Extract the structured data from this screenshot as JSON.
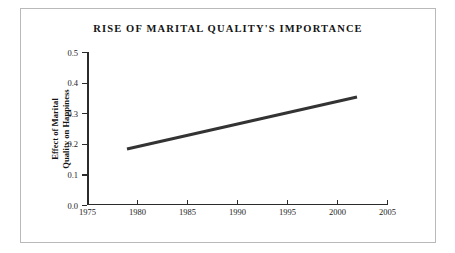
{
  "chart_data": {
    "type": "line",
    "title": "RISE OF MARITAL QUALITY'S IMPORTANCE",
    "xlabel": "",
    "ylabel_lines": [
      "Effect of Marital",
      "Quality on Happiness"
    ],
    "ylabel": "Effect of Marital Quality on Happiness",
    "xlim": [
      1975,
      2005
    ],
    "ylim": [
      0.0,
      0.5
    ],
    "xticks": [
      1975,
      1980,
      1985,
      1990,
      1995,
      2000,
      2005
    ],
    "xtick_labels": [
      "1975",
      "1980",
      "1985",
      "1990",
      "1995",
      "2000",
      "2005"
    ],
    "yticks": [
      0.0,
      0.1,
      0.2,
      0.3,
      0.4,
      0.5
    ],
    "ytick_labels": [
      "0.0",
      "0.1",
      "0.2",
      "0.3",
      "0.4",
      "0.5"
    ],
    "grid": false,
    "legend": false,
    "series": [
      {
        "name": "Effect of marital quality on happiness",
        "color": "#333333",
        "linewidth": 3,
        "x": [
          1979,
          2002
        ],
        "values": [
          0.183,
          0.353
        ]
      }
    ]
  },
  "figure": {
    "border_color": "#b9b9b9",
    "background": "#ffffff",
    "axis_color": "#2b2b2b"
  }
}
